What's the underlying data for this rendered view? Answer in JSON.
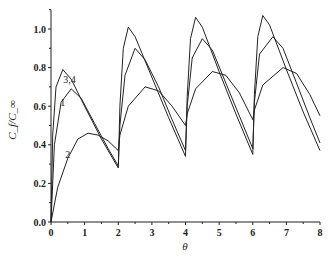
{
  "chart_data": {
    "type": "line",
    "title": "",
    "xlabel": "θ",
    "ylabel": "C_f/C_∞",
    "xlim": [
      0,
      8
    ],
    "ylim": [
      0,
      1.1
    ],
    "xticks": [
      "0",
      "1",
      "2",
      "3",
      "4",
      "5",
      "6",
      "7",
      "8"
    ],
    "yticks": [
      "0.0",
      "0.2",
      "0.4",
      "0.6",
      "0.8",
      "1.0"
    ],
    "grid": false,
    "legend": "none (inline curve labels)",
    "annotations": [
      {
        "text": "1",
        "x": 0.35,
        "y": 0.6
      },
      {
        "text": "3,4",
        "x": 0.55,
        "y": 0.72
      },
      {
        "text": "2",
        "x": 0.5,
        "y": 0.33
      }
    ],
    "series": [
      {
        "name": "curve-high",
        "points": [
          [
            0,
            0
          ],
          [
            0.05,
            0.45
          ],
          [
            0.15,
            0.7
          ],
          [
            0.35,
            0.79
          ],
          [
            0.6,
            0.74
          ],
          [
            1.0,
            0.6
          ],
          [
            1.5,
            0.43
          ],
          [
            2.0,
            0.28
          ],
          [
            2.05,
            0.6
          ],
          [
            2.15,
            0.9
          ],
          [
            2.3,
            1.01
          ],
          [
            2.5,
            0.96
          ],
          [
            3.0,
            0.75
          ],
          [
            3.5,
            0.54
          ],
          [
            4.0,
            0.34
          ],
          [
            4.05,
            0.65
          ],
          [
            4.15,
            0.95
          ],
          [
            4.3,
            1.06
          ],
          [
            4.5,
            1.01
          ],
          [
            5.0,
            0.78
          ],
          [
            5.5,
            0.56
          ],
          [
            6.0,
            0.35
          ],
          [
            6.05,
            0.66
          ],
          [
            6.15,
            0.96
          ],
          [
            6.3,
            1.07
          ],
          [
            6.5,
            1.02
          ],
          [
            7.0,
            0.79
          ],
          [
            7.5,
            0.57
          ],
          [
            8.0,
            0.37
          ]
        ]
      },
      {
        "name": "curve-mid",
        "points": [
          [
            0,
            0
          ],
          [
            0.1,
            0.4
          ],
          [
            0.3,
            0.62
          ],
          [
            0.6,
            0.69
          ],
          [
            0.9,
            0.64
          ],
          [
            1.3,
            0.51
          ],
          [
            1.7,
            0.38
          ],
          [
            2.0,
            0.29
          ],
          [
            2.05,
            0.5
          ],
          [
            2.2,
            0.76
          ],
          [
            2.5,
            0.9
          ],
          [
            2.8,
            0.84
          ],
          [
            3.2,
            0.7
          ],
          [
            3.6,
            0.53
          ],
          [
            4.0,
            0.37
          ],
          [
            4.05,
            0.6
          ],
          [
            4.2,
            0.85
          ],
          [
            4.5,
            0.95
          ],
          [
            4.8,
            0.89
          ],
          [
            5.2,
            0.72
          ],
          [
            5.6,
            0.55
          ],
          [
            6.0,
            0.38
          ],
          [
            6.05,
            0.62
          ],
          [
            6.2,
            0.87
          ],
          [
            6.6,
            0.96
          ],
          [
            6.9,
            0.9
          ],
          [
            7.3,
            0.72
          ],
          [
            7.7,
            0.54
          ],
          [
            8.0,
            0.41
          ]
        ]
      },
      {
        "name": "curve-low",
        "points": [
          [
            0,
            0
          ],
          [
            0.2,
            0.18
          ],
          [
            0.5,
            0.33
          ],
          [
            0.8,
            0.43
          ],
          [
            1.1,
            0.46
          ],
          [
            1.4,
            0.45
          ],
          [
            1.7,
            0.42
          ],
          [
            2.0,
            0.37
          ],
          [
            2.05,
            0.45
          ],
          [
            2.3,
            0.6
          ],
          [
            2.8,
            0.7
          ],
          [
            3.2,
            0.68
          ],
          [
            3.6,
            0.6
          ],
          [
            4.0,
            0.5
          ],
          [
            4.05,
            0.56
          ],
          [
            4.3,
            0.69
          ],
          [
            4.8,
            0.78
          ],
          [
            5.2,
            0.76
          ],
          [
            5.6,
            0.67
          ],
          [
            6.0,
            0.53
          ],
          [
            6.05,
            0.58
          ],
          [
            6.3,
            0.71
          ],
          [
            6.9,
            0.8
          ],
          [
            7.3,
            0.77
          ],
          [
            7.7,
            0.66
          ],
          [
            8.0,
            0.55
          ]
        ]
      }
    ]
  }
}
